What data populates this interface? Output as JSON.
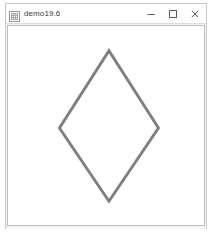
{
  "window": {
    "title": "demo19.6",
    "icon": "app-icon",
    "controls": [
      {
        "name": "minimize-button",
        "glyph": "minimize-icon",
        "label": "–"
      },
      {
        "name": "maximize-button",
        "glyph": "maximize-icon",
        "label": "□"
      },
      {
        "name": "close-button",
        "glyph": "close-icon",
        "label": "×"
      }
    ]
  },
  "canvas": {
    "background_color": "#ffffff",
    "border_color": "#bdbdbd",
    "width": 198,
    "height": 201,
    "shape": {
      "name": "rhombus",
      "type": "polygon",
      "stroke_color": "#808080",
      "stroke_width": 3,
      "fill": "none",
      "points": "102,25 152,103 102,177 52,103",
      "vertices": [
        {
          "label": "top",
          "x": 102,
          "y": 25
        },
        {
          "label": "right",
          "x": 152,
          "y": 103
        },
        {
          "label": "bottom",
          "x": 102,
          "y": 177
        },
        {
          "label": "left",
          "x": 52,
          "y": 103
        }
      ]
    }
  }
}
